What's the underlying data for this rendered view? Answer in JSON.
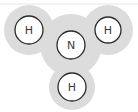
{
  "diagram": {
    "colors": {
      "halo": "#dcdcdc",
      "atom_fill": "#ffffff",
      "atom_stroke": "#2b2b2b",
      "top_line": "#e6e6e6"
    },
    "atoms": [
      {
        "id": "h-left",
        "label": "H",
        "cx": 29,
        "cy": 30,
        "r": 14,
        "halo_r": 25
      },
      {
        "id": "n-center",
        "label": "N",
        "cx": 71,
        "cy": 45,
        "r": 14,
        "halo_r": 31
      },
      {
        "id": "h-right",
        "label": "H",
        "cx": 108,
        "cy": 30,
        "r": 13,
        "halo_r": 25
      },
      {
        "id": "h-bottom",
        "label": "H",
        "cx": 72,
        "cy": 87,
        "r": 14,
        "halo_r": 23
      }
    ]
  }
}
